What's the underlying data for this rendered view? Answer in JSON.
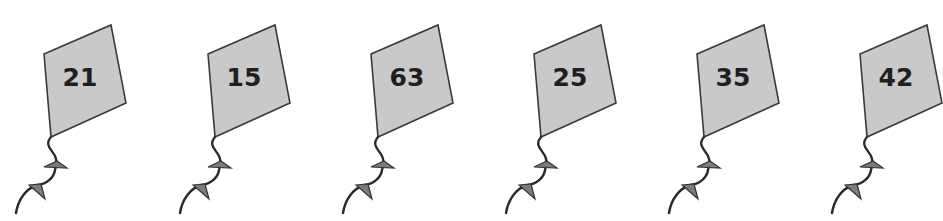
{
  "kites": [
    {
      "label": "21",
      "dx": 0
    },
    {
      "label": "15",
      "dx": 164
    },
    {
      "label": "63",
      "dx": 327
    },
    {
      "label": "25",
      "dx": 490
    },
    {
      "label": "35",
      "dx": 653
    },
    {
      "label": "42",
      "dx": 816
    }
  ],
  "colors": {
    "kite_fill": "#c9c9c9",
    "kite_outline": "#3a3a3a",
    "bow_fill": "#7b7b7b",
    "number_text": "#1f1f1f",
    "background": "#ffffff"
  }
}
